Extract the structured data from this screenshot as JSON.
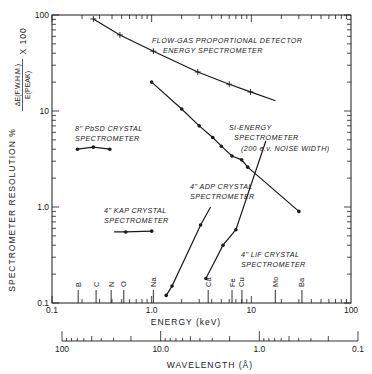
{
  "chart_data": {
    "type": "line",
    "title": "",
    "xlabel": "ENERGY (keV)",
    "x2label": "WAVELENGTH (Å)",
    "ylabel": "SPECTROMETER RESOLUTION %",
    "ylabel_formula": {
      "numerator": "ΔE(F.W.H.M.)",
      "denominator": "E(PEAK)",
      "factor": "X 100"
    },
    "xscale": "log",
    "yscale": "log",
    "xlim": [
      0.1,
      100
    ],
    "ylim": [
      0.1,
      100
    ],
    "x2lim": [
      100,
      0.1
    ],
    "x_ticks": [
      "0.1",
      "1.0",
      "10",
      "100"
    ],
    "y_ticks": [
      "0.1",
      "1.0",
      "10",
      "100"
    ],
    "x2_ticks": [
      "100",
      "10.0",
      "1.0",
      "0.1"
    ],
    "grid": false,
    "legend": "none (inline annotations)",
    "element_markers": [
      {
        "label": "B",
        "energy": 0.183
      },
      {
        "label": "C",
        "energy": 0.277
      },
      {
        "label": "N",
        "energy": 0.392
      },
      {
        "label": "O",
        "energy": 0.525
      },
      {
        "label": "Na",
        "energy": 1.04
      },
      {
        "label": "Ca",
        "energy": 3.69
      },
      {
        "label": "Fe",
        "energy": 6.4
      },
      {
        "label": "Cu",
        "energy": 8.05
      },
      {
        "label": "Mo",
        "energy": 17.4
      },
      {
        "label": "Ba",
        "energy": 32.2
      }
    ],
    "series": [
      {
        "name": "FLOW-GAS PROPORTIONAL DETECTOR ENERGY SPECTROMETER",
        "marker": "plus",
        "x": [
          0.26,
          0.48,
          1.04,
          2.9,
          6.0,
          9.8
        ],
        "y": [
          91,
          62,
          42,
          25.5,
          19,
          15.8
        ],
        "line_end": [
          17.5,
          12.8
        ]
      },
      {
        "name": "Si-ENERGY SPECTROMETER (200 e.v. NOISE WIDTH)",
        "marker": "dot",
        "x": [
          1.0,
          2.0,
          3.0,
          4.1,
          5.0,
          6.4,
          8.0,
          9.2,
          30
        ],
        "y": [
          20,
          10.5,
          7.0,
          5.3,
          4.3,
          3.4,
          3.1,
          2.6,
          0.9
        ]
      },
      {
        "name": "8\" PbSD CRYSTAL SPECTROMETER",
        "marker": "dot",
        "x": [
          0.18,
          0.26,
          0.38
        ],
        "y": [
          4.0,
          4.2,
          4.0
        ]
      },
      {
        "name": "4\" KAP CRYSTAL SPECTROMETER",
        "marker": "dot",
        "x": [
          0.55,
          1.0
        ],
        "y": [
          0.55,
          0.56
        ],
        "line_start": [
          0.42,
          0.55
        ]
      },
      {
        "name": "4\" ADP CRYSTAL SPECTROMETER",
        "marker": "dot",
        "x": [
          1.4,
          1.6,
          3.1
        ],
        "y": [
          0.12,
          0.15,
          0.65
        ],
        "line_end": [
          3.9,
          1.0
        ]
      },
      {
        "name": "4\" LiF CRYSTAL SPECTROMETER",
        "marker": "dot",
        "x": [
          3.5,
          5.2,
          7.0
        ],
        "y": [
          0.18,
          0.4,
          0.58
        ],
        "line_end": [
          14,
          4.9
        ]
      }
    ]
  },
  "annotations": {
    "flow_gas_line1": "FLOW-GAS PROPORTIONAL DETECTOR",
    "flow_gas_line2": "ENERGY SPECTROMETER",
    "pbsd_line1": "8\" PbSD CRYSTAL",
    "pbsd_line2": "SPECTROMETER",
    "si_line1": "Si-ENERGY",
    "si_line2": "SPECTROMETER",
    "si_line3": "(200 e.v. NOISE WIDTH)",
    "kap_line1": "4\" KAP CRYSTAL",
    "kap_line2": "SPECTROMETER",
    "adp_line1": "4\" ADP CRYSTAL",
    "adp_line2": "SPECTROMETER",
    "lif_line1": "4\" LiF CRYSTAL",
    "lif_line2": "SPECTROMETER"
  },
  "axes": {
    "y_title_main": "SPECTROMETER RESOLUTION %",
    "y_title_num": "ΔE(F.W.H.M.)",
    "y_title_den": "E(PEAK)",
    "y_title_factor": "X 100",
    "x_title": "ENERGY (keV)",
    "x2_title": "WAVELENGTH (Å)"
  },
  "colors": {
    "ink": "#1a1a1a",
    "background": "#ffffff"
  }
}
